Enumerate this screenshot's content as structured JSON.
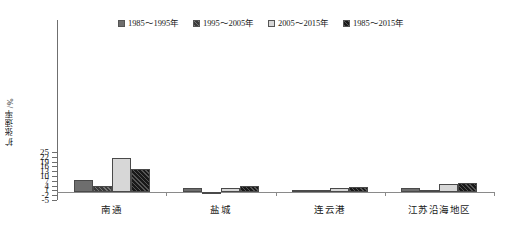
{
  "chart_data": {
    "type": "bar",
    "title": "",
    "xlabel": "",
    "ylabel": "扩张速率/%",
    "ylim": [
      -5,
      25
    ],
    "ytick_step": 3,
    "yticks": [
      25,
      22,
      19,
      16,
      13,
      10,
      7,
      4,
      1,
      -2,
      -5
    ],
    "grid": false,
    "legend_position": "top",
    "categories": [
      "南通",
      "盐城",
      "连云港",
      "江苏沿海地区"
    ],
    "series": [
      {
        "name": "1985～1995年",
        "fill": "solid-gray",
        "color": "#6e6e6e",
        "values": [
          7.4,
          2.5,
          1.2,
          2.2
        ]
      },
      {
        "name": "1995～2005年",
        "fill": "hatched-dark",
        "color": "#3a3a3a",
        "values": [
          4.0,
          -0.8,
          0.2,
          0.2
        ]
      },
      {
        "name": "2005～2015年",
        "fill": "solid-light",
        "color": "#d7d7d7",
        "values": [
          21.0,
          2.5,
          2.8,
          5.0
        ]
      },
      {
        "name": "1985～2015年",
        "fill": "hatched-black",
        "color": "#191919",
        "values": [
          14.1,
          4.0,
          3.3,
          5.8
        ]
      }
    ]
  },
  "axis": {
    "y_title": "扩张速率/%",
    "tick_labels": [
      "25",
      "22",
      "19",
      "16",
      "13",
      "10",
      "7",
      "4",
      "1",
      "-2",
      "-5"
    ]
  },
  "legend": {
    "items": [
      {
        "label": "1985～1995年"
      },
      {
        "label": "1995～2005年"
      },
      {
        "label": "2005～2015年"
      },
      {
        "label": "1985～2015年"
      }
    ]
  }
}
